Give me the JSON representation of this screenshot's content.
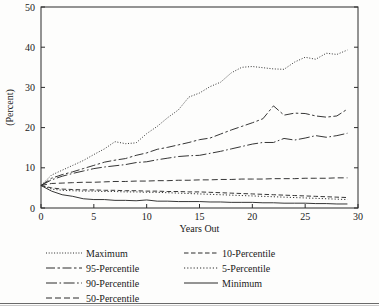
{
  "chart_data": {
    "type": "line",
    "title": "",
    "xlabel": "Years Out",
    "ylabel": "(Percent)",
    "xlim": [
      0,
      30
    ],
    "ylim": [
      0,
      50
    ],
    "xticks": [
      0,
      5,
      10,
      15,
      20,
      25,
      30
    ],
    "yticks": [
      0,
      10,
      20,
      30,
      40,
      50
    ],
    "xtick_labels": [
      "0",
      "5",
      "10",
      "15",
      "20",
      "25",
      "30"
    ],
    "ytick_labels": [
      "0",
      "10",
      "20",
      "30",
      "40",
      "50"
    ],
    "grid": false,
    "legend_position": "below",
    "line_color": "#2b2b2b",
    "x": [
      0,
      1,
      2,
      3,
      4,
      5,
      6,
      7,
      8,
      9,
      10,
      11,
      12,
      13,
      14,
      15,
      16,
      17,
      18,
      19,
      20,
      21,
      22,
      23,
      24,
      25,
      26,
      27,
      28,
      29
    ],
    "series": [
      {
        "name": "Maximum",
        "dash": "dotted",
        "values": [
          5.6,
          8.2,
          9.4,
          10.6,
          11.8,
          13.3,
          14.7,
          16.5,
          16.0,
          16.2,
          18.5,
          20.3,
          22.5,
          24.4,
          27.6,
          28.6,
          30.2,
          31.3,
          33.6,
          35.0,
          35.2,
          34.9,
          34.6,
          34.5,
          36.3,
          37.5,
          37.0,
          38.5,
          38.2,
          39.3
        ]
      },
      {
        "name": "95-Percentile",
        "dash": "dash-dot-long",
        "values": [
          5.6,
          7.4,
          8.3,
          9.0,
          9.8,
          10.6,
          11.4,
          11.9,
          12.3,
          13.1,
          13.7,
          14.6,
          15.1,
          15.7,
          16.3,
          17.0,
          17.4,
          18.4,
          19.4,
          20.3,
          21.2,
          22.2,
          25.4,
          23.1,
          23.6,
          23.5,
          22.9,
          22.6,
          22.9,
          24.6
        ]
      },
      {
        "name": "90-Percentile",
        "dash": "dash-dot-short",
        "values": [
          5.6,
          7.0,
          7.9,
          8.6,
          9.2,
          9.8,
          10.2,
          10.5,
          10.8,
          11.3,
          11.5,
          12.0,
          12.4,
          12.8,
          13.0,
          13.1,
          13.6,
          14.1,
          14.7,
          15.3,
          15.9,
          16.3,
          16.3,
          17.3,
          16.9,
          17.4,
          18.0,
          17.6,
          18.0,
          18.6
        ]
      },
      {
        "name": "50-Percentile",
        "dash": "dashed",
        "values": [
          5.6,
          6.1,
          6.2,
          6.3,
          6.4,
          6.4,
          6.5,
          6.6,
          6.6,
          6.7,
          6.7,
          6.8,
          6.8,
          6.9,
          6.9,
          7.0,
          7.0,
          7.1,
          7.1,
          7.2,
          7.2,
          7.2,
          7.3,
          7.3,
          7.3,
          7.4,
          7.4,
          7.4,
          7.5,
          7.5
        ]
      },
      {
        "name": "10-Percentile",
        "dash": "dashed-fine",
        "values": [
          5.6,
          5.0,
          4.7,
          4.6,
          4.5,
          4.5,
          4.4,
          4.4,
          4.3,
          4.3,
          4.2,
          4.2,
          4.1,
          4.1,
          4.0,
          4.0,
          3.9,
          3.8,
          3.7,
          3.6,
          3.5,
          3.4,
          3.3,
          3.2,
          3.1,
          3.0,
          2.9,
          2.8,
          2.7,
          2.6
        ]
      },
      {
        "name": "5-Percentile",
        "dash": "dotted-fine",
        "values": [
          5.6,
          4.7,
          4.4,
          4.3,
          4.2,
          4.2,
          4.1,
          4.1,
          4.0,
          4.0,
          3.9,
          3.9,
          3.8,
          3.7,
          3.6,
          3.5,
          3.4,
          3.3,
          3.2,
          3.1,
          3.0,
          2.9,
          2.8,
          2.7,
          2.6,
          2.5,
          2.4,
          2.3,
          2.2,
          2.1
        ]
      },
      {
        "name": "Minimum",
        "dash": "solid",
        "values": [
          5.6,
          4.2,
          3.3,
          2.9,
          2.3,
          2.1,
          2.1,
          1.9,
          1.9,
          1.8,
          2.0,
          1.7,
          1.7,
          1.6,
          1.6,
          1.6,
          1.5,
          1.5,
          1.4,
          1.4,
          1.4,
          1.3,
          1.3,
          1.2,
          1.2,
          1.2,
          1.1,
          1.1,
          1.0,
          1.0
        ]
      }
    ]
  },
  "legend": {
    "column_left": [
      {
        "label": "Maximum",
        "style": "dotted"
      },
      {
        "label": "95-Percentile",
        "style": "dash-dot-long"
      },
      {
        "label": "90-Percentile",
        "style": "dash-dot-short"
      },
      {
        "label": "50-Percentile",
        "style": "dashed"
      }
    ],
    "column_right": [
      {
        "label": "10-Percentile",
        "style": "dashed-fine"
      },
      {
        "label": "5-Percentile",
        "style": "dotted-fine"
      },
      {
        "label": "Minimum",
        "style": "solid"
      }
    ]
  }
}
